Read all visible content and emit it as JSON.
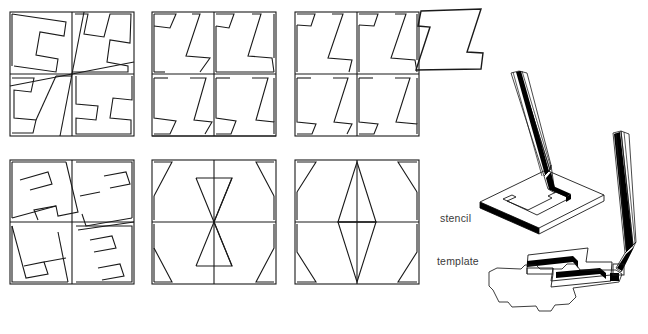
{
  "figure": {
    "kind": "geometric-tessellation-plate",
    "background_color": "#ffffff",
    "line_color": "#1a1a1a",
    "fill_color": "#000000"
  },
  "labels": {
    "stencil": "stencil",
    "template": "template"
  },
  "tiles": {
    "description": "Z-shaped / S-shaped tessellation tile repeated in square panels",
    "single_tile_name": "z-tile"
  },
  "panels": [
    {
      "id": "panel-1",
      "row": 1,
      "col": 1,
      "name": "pinwheel-z-tiling",
      "x": 10,
      "y": 12,
      "size": 124
    },
    {
      "id": "panel-2",
      "row": 1,
      "col": 2,
      "name": "slanted-z-tiling",
      "x": 152,
      "y": 12,
      "size": 124
    },
    {
      "id": "panel-3",
      "row": 1,
      "col": 3,
      "name": "steep-z-tiling",
      "x": 295,
      "y": 12,
      "size": 124
    },
    {
      "id": "panel-4",
      "row": 2,
      "col": 1,
      "name": "rotated-pinwheel-tiling",
      "x": 10,
      "y": 160,
      "size": 124
    },
    {
      "id": "panel-5",
      "row": 2,
      "col": 2,
      "name": "bowtie-tiling",
      "x": 152,
      "y": 160,
      "size": 124
    },
    {
      "id": "panel-6",
      "row": 2,
      "col": 3,
      "name": "triangle-pair-tiling",
      "x": 295,
      "y": 160,
      "size": 124
    }
  ],
  "single_tile": {
    "id": "tile-z",
    "x": 415,
    "y": 8,
    "width": 68,
    "height": 62
  },
  "illustration": {
    "name": "stencil-and-template-diagram",
    "items": [
      {
        "name": "stencil-plate",
        "note": "flat plate with Z-shaped cut-out, pencil drawing inside"
      },
      {
        "name": "stencil-pencil",
        "note": "pencil tip inside the cut-out"
      },
      {
        "name": "template-plate",
        "note": "solid Z-shaped plate, pencil tracing outside edge"
      },
      {
        "name": "template-pencil",
        "note": "pencil tip at plate corner"
      },
      {
        "name": "traced-outline",
        "note": "traced Z outline below the template plate"
      }
    ]
  }
}
